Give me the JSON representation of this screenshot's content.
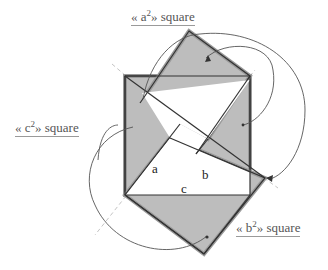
{
  "diagram": {
    "labels": {
      "a_square": {
        "prefix": "« a",
        "sup": "2",
        "suffix": "» square"
      },
      "b_square": {
        "prefix": "« b",
        "sup": "2",
        "suffix": "» square"
      },
      "c_square": {
        "prefix": "« c",
        "sup": "2",
        "suffix": "» square"
      }
    },
    "sides": {
      "a": "a",
      "b": "b",
      "c": "c"
    },
    "colors": {
      "fill": "#bdbdbd",
      "stroke_dark": "#333333",
      "stroke_halo": "#9a9a9a",
      "arrow": "#555555",
      "dash": "#bbbbbb"
    }
  }
}
